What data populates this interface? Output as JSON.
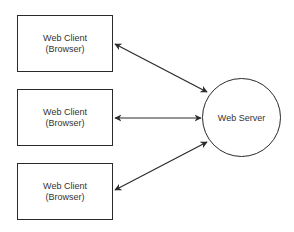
{
  "diagram": {
    "type": "client-server",
    "clients": [
      {
        "line1": "Web Client",
        "line2": "(Browser)"
      },
      {
        "line1": "Web Client",
        "line2": "(Browser)"
      },
      {
        "line1": "Web Client",
        "line2": "(Browser)"
      }
    ],
    "server": {
      "label": "Web Server"
    },
    "edges": [
      {
        "from": "client-1",
        "to": "server",
        "direction": "bidirectional"
      },
      {
        "from": "client-2",
        "to": "server",
        "direction": "bidirectional"
      },
      {
        "from": "client-3",
        "to": "server",
        "direction": "bidirectional"
      }
    ],
    "colors": {
      "stroke": "#2a2a2a",
      "text": "#333333",
      "background": "#ffffff"
    }
  }
}
